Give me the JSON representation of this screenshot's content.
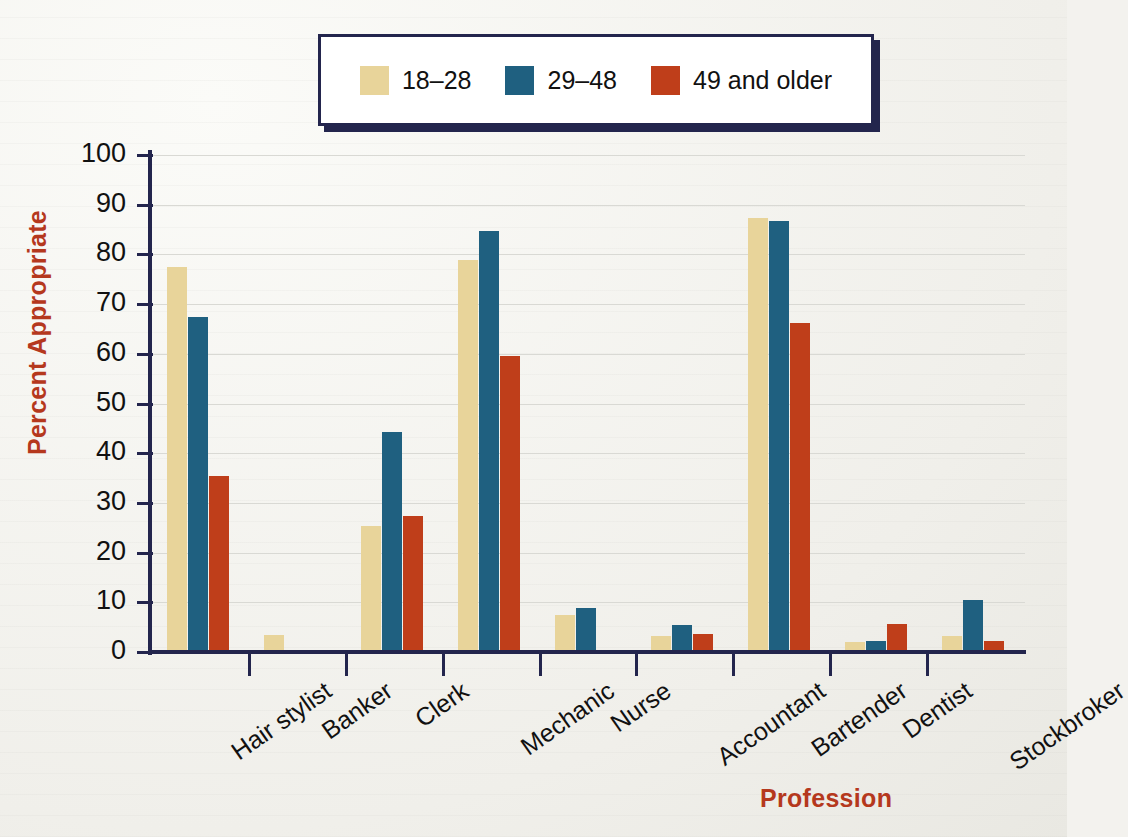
{
  "chart_data": {
    "type": "bar",
    "title": "",
    "xlabel": "Profession",
    "ylabel": "Percent Appropriate",
    "ylim": [
      0,
      100
    ],
    "ytick_labels": [
      "100",
      "90",
      "80",
      "70",
      "60",
      "50",
      "40",
      "30",
      "20",
      "10",
      "0"
    ],
    "ytick_values": [
      100,
      90,
      80,
      70,
      60,
      50,
      40,
      30,
      20,
      10,
      0
    ],
    "grid": true,
    "legend_position": "top",
    "categories": [
      "Hair stylist",
      "Banker",
      "Clerk",
      "Mechanic",
      "Nurse",
      "Accountant",
      "Bartender",
      "Dentist",
      "Stockbroker"
    ],
    "series": [
      {
        "name": "18–28",
        "color": "#E8D49A",
        "values": [
          77.5,
          3.5,
          25.3,
          78.8,
          7.5,
          3.3,
          87.3,
          2.0,
          3.2
        ]
      },
      {
        "name": "29–48",
        "color": "#1F6080",
        "values": [
          67.5,
          0,
          44.2,
          84.8,
          8.9,
          5.5,
          86.8,
          2.2,
          10.4
        ]
      },
      {
        "name": "49 and older",
        "color": "#BF3E1A",
        "values": [
          35.4,
          0,
          27.4,
          59.5,
          0,
          3.7,
          66.2,
          5.6,
          2.2
        ]
      }
    ]
  },
  "legend": {
    "items": [
      {
        "label": "18–28",
        "color": "#E8D49A"
      },
      {
        "label": "29–48",
        "color": "#1F6080"
      },
      {
        "label": "49 and older",
        "color": "#BF3E1A"
      }
    ]
  },
  "colors": {
    "accent_red": "#B5381D",
    "axis_navy": "#23254D",
    "gridline": "#D9D9D4",
    "background": "#F3F2EE"
  }
}
